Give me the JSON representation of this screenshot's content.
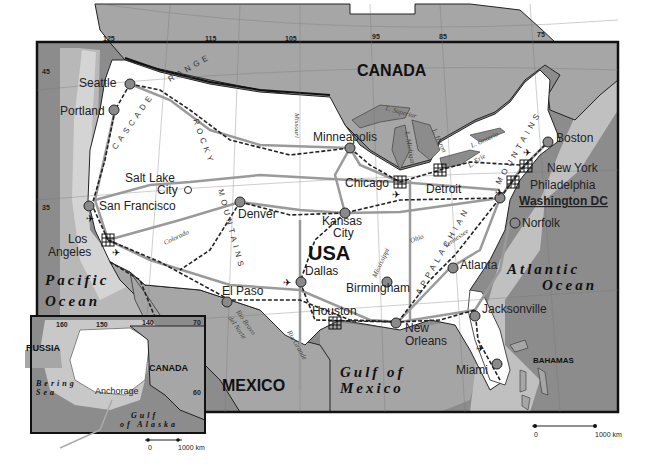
{
  "map": {
    "countries": {
      "usa": "USA",
      "canada": "CANADA",
      "mexico": "MEXICO",
      "bahamas": "BAHAMAS",
      "russia": "RUSSIA",
      "canada_inset": "CANADA"
    },
    "oceans": {
      "pacific_1": "Pacific",
      "pacific_2": "Ocean",
      "atlantic_1": "Atlantic",
      "atlantic_2": "Ocean",
      "gulf_1": "Gulf of",
      "gulf_2": "Mexico",
      "bering_1": "Bering",
      "bering_2": "Sea",
      "alaska_gulf_1": "Gulf",
      "alaska_gulf_2": "of Alaska"
    },
    "cities": [
      {
        "name": "Seattle"
      },
      {
        "name": "Portland"
      },
      {
        "name": "Salt Lake",
        "name2": "City"
      },
      {
        "name": "San Francisco"
      },
      {
        "name": "Los",
        "name2": "Angeles"
      },
      {
        "name": "Denver"
      },
      {
        "name": "Minneapolis"
      },
      {
        "name": "Kansas",
        "name2": "City"
      },
      {
        "name": "Chicago"
      },
      {
        "name": "Detroit"
      },
      {
        "name": "Boston"
      },
      {
        "name": "New York"
      },
      {
        "name": "Philadelphia"
      },
      {
        "name": "Washington DC"
      },
      {
        "name": "Norfolk"
      },
      {
        "name": "Atlanta"
      },
      {
        "name": "Birmingham"
      },
      {
        "name": "Dallas"
      },
      {
        "name": "El Paso"
      },
      {
        "name": "Houston"
      },
      {
        "name": "New",
        "name2": "Orleans"
      },
      {
        "name": "Jacksonville"
      },
      {
        "name": "Miami"
      },
      {
        "name": "Anchorage"
      }
    ],
    "ranges": {
      "cascade": "CASCADE",
      "range": "RANGE",
      "rocky": "ROCKY",
      "mountains": "MOUNTAINS",
      "appalachian": "APPALACHIAN",
      "appal_mountains": "MOUNTAINS"
    },
    "rivers": {
      "missouri": "Missouri",
      "colorado": "Colorado",
      "mississippi": "Mississippi",
      "ohio": "Ohio",
      "tennessee": "Tennessee",
      "rio_bravo": "Rio Bravo",
      "del_norte": "del Norte",
      "rio_grande": "Rio Grande"
    },
    "lakes": {
      "superior": "L. Superior",
      "michigan": "L. Michigan",
      "huron": "L. Huron",
      "erie": "L. Erie",
      "ontario": "L. Ontario"
    },
    "longitude_ticks": [
      "125",
      "115",
      "105",
      "95",
      "85",
      "75"
    ],
    "latitude_ticks": [
      "45",
      "35"
    ],
    "inset_ticks": {
      "lon": [
        "160",
        "150",
        "140",
        "70"
      ],
      "lat": [
        "60"
      ]
    },
    "scale_bar": {
      "start": "0",
      "end": "1000 km"
    },
    "inset_scale_bar": {
      "start": "0",
      "end": "1000 km"
    },
    "colors": {
      "ocean": "#8c8c8c",
      "land_foreign": "#a6a6a6",
      "land_usa": "#ffffff",
      "shelf": "#c8c8c8",
      "road": "#9a9a9a",
      "rail": "#333333",
      "city_dot": "#8a8a8a"
    }
  }
}
